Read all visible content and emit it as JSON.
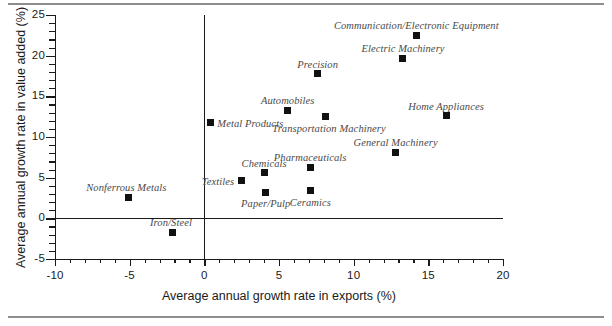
{
  "figure": {
    "background_color": "#ffffff",
    "rule_color": "#8d8d8d",
    "marker_color": "#111111",
    "label_color": "#4a4a4a",
    "axis_color": "#1a1a1a"
  },
  "chart_data": {
    "type": "scatter",
    "title": "",
    "xlabel": "Average annual growth rate in exports (%)",
    "ylabel": "Average annual growth rate in value added (%)",
    "xlim": [
      -10,
      20
    ],
    "ylim": [
      -5,
      25
    ],
    "xticks": [
      -10,
      -5,
      0,
      5,
      10,
      15,
      20
    ],
    "xtick_labels": [
      "-10",
      "-5",
      "0",
      "5",
      "10",
      "15",
      "20"
    ],
    "yticks": [
      -5,
      0,
      5,
      10,
      15,
      20,
      25
    ],
    "ytick_labels": [
      "-5",
      "0",
      "5",
      "10",
      "15",
      "20",
      "25"
    ],
    "x_minor_tick_step": 1,
    "y_minor_tick_step": 1,
    "grid": false,
    "legend": "none",
    "reference_lines": [
      {
        "axis": "y",
        "value": 0
      },
      {
        "axis": "x",
        "value": 0
      }
    ],
    "points": [
      {
        "label": "Nonferrous Metals",
        "x": -5.1,
        "y": 2.6,
        "label_pos": "above-left"
      },
      {
        "label": "Iron/Steel",
        "x": -2.1,
        "y": -1.7,
        "label_pos": "above-left"
      },
      {
        "label": "Metal Products",
        "x": 0.4,
        "y": 11.8,
        "label_pos": "right"
      },
      {
        "label": "Textiles",
        "x": 2.5,
        "y": 4.6,
        "label_pos": "left"
      },
      {
        "label": "Chemicals",
        "x": 4.0,
        "y": 5.6,
        "label_pos": "above"
      },
      {
        "label": "Paper/Pulp",
        "x": 4.1,
        "y": 3.2,
        "label_pos": "below"
      },
      {
        "label": "Automobiles",
        "x": 5.6,
        "y": 13.3,
        "label_pos": "above"
      },
      {
        "label": "Pharmaceuticals",
        "x": 7.1,
        "y": 6.3,
        "label_pos": "above"
      },
      {
        "label": "Ceramics",
        "x": 7.1,
        "y": 3.4,
        "label_pos": "below"
      },
      {
        "label": "Precision",
        "x": 7.6,
        "y": 17.8,
        "label_pos": "above"
      },
      {
        "label": "Transportation Machinery",
        "x": 8.1,
        "y": 12.5,
        "label_pos": "below-right"
      },
      {
        "label": "General Machinery",
        "x": 12.8,
        "y": 8.1,
        "label_pos": "above"
      },
      {
        "label": "Electric Machinery",
        "x": 13.3,
        "y": 19.7,
        "label_pos": "above"
      },
      {
        "label": "Communication/Electronic Equipment",
        "x": 14.2,
        "y": 22.5,
        "label_pos": "above"
      },
      {
        "label": "Home Appliances",
        "x": 16.2,
        "y": 12.6,
        "label_pos": "above"
      }
    ]
  }
}
